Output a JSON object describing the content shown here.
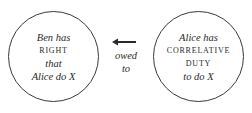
{
  "left_circle": {
    "line1": "Ben has",
    "line2": "right",
    "line3": "that",
    "line4": "Alice do X"
  },
  "right_circle": {
    "line1": "Alice has",
    "line2": "correlative",
    "line3": "duty",
    "line4": "to do X"
  },
  "connector": {
    "icon": "arrow-left-icon",
    "label_line1": "owed",
    "label_line2": "to"
  },
  "colors": {
    "stroke": "#3a3a3a",
    "text": "#2a2a2a",
    "background": "#ffffff"
  }
}
